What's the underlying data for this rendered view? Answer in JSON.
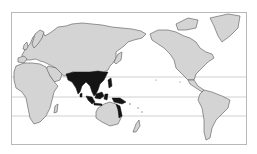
{
  "map": {
    "type": "world-map",
    "projection": "pacific-centered",
    "colors": {
      "background": "#ffffff",
      "land": "#d4d4d4",
      "border": "#555555",
      "highlight": "#141414",
      "graticule": "#bdbdbd",
      "frame": "#b8b8b8"
    },
    "reference_lines": [
      "tropic-of-cancer",
      "equator",
      "tropic-of-capricorn"
    ],
    "highlighted_region": "South and Southeast Asia",
    "highlighted_areas": [
      "India",
      "Bangladesh",
      "Myanmar",
      "Thailand",
      "Laos",
      "Cambodia",
      "Vietnam",
      "Southern China",
      "Malaysia",
      "Indonesia",
      "Philippines",
      "Papua New Guinea",
      "Northern Australia (Queensland coast)"
    ]
  }
}
